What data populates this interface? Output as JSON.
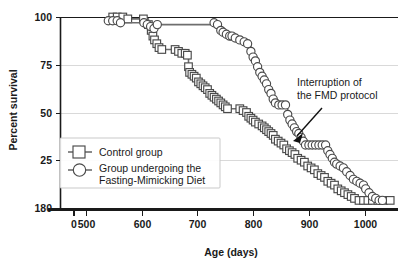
{
  "chart_data": {
    "type": "line",
    "title": "",
    "subtitle": "",
    "xlabel": "Age (days)",
    "ylabel": "Percent survival",
    "xlim": [
      500,
      1060
    ],
    "ylim": [
      0,
      100
    ],
    "grid": true,
    "grid_axis": "y",
    "legend_position": "lower-left-inside",
    "axis_break": {
      "axis": "x",
      "between": [
        0,
        500
      ],
      "note": "broken x axis between 0 and 500"
    },
    "xticks": [
      {
        "value": 0,
        "label": "0"
      },
      {
        "value": 500,
        "label": "500"
      },
      {
        "value": 600,
        "label": "600"
      },
      {
        "value": 700,
        "label": "700"
      },
      {
        "value": 800,
        "label": "800"
      },
      {
        "value": 900,
        "label": "900"
      },
      {
        "value": 1000,
        "label": "1000"
      }
    ],
    "yticks": [
      {
        "value": 0,
        "label": "180"
      },
      {
        "value": 25,
        "label": "25"
      },
      {
        "value": 50,
        "label": "50"
      },
      {
        "value": 75,
        "label": "75"
      },
      {
        "value": 100,
        "label": "100"
      }
    ],
    "annotations": [
      {
        "name": "interruption-annotation",
        "lines": [
          "Interruption of",
          "the FMD protocol"
        ],
        "text_x": 930,
        "text_y": 72,
        "arrow_from": [
          925,
          62
        ],
        "arrow_to": [
          897,
          36
        ]
      }
    ],
    "series": [
      {
        "name": "Control group",
        "legend_label": "Control group",
        "marker": "square",
        "color": "#4a4a4a",
        "line_color": "#6e6e6e",
        "points": [
          [
            548,
            100
          ],
          [
            556,
            100
          ],
          [
            566,
            100
          ],
          [
            575,
            99
          ],
          [
            603,
            99
          ],
          [
            612,
            96
          ],
          [
            617,
            93
          ],
          [
            620,
            90
          ],
          [
            623,
            88
          ],
          [
            627,
            86
          ],
          [
            631,
            84
          ],
          [
            636,
            83
          ],
          [
            660,
            83
          ],
          [
            666,
            82
          ],
          [
            672,
            81
          ],
          [
            678,
            81
          ],
          [
            682,
            80
          ],
          [
            684,
            74
          ],
          [
            686,
            71
          ],
          [
            690,
            70
          ],
          [
            694,
            69
          ],
          [
            698,
            68
          ],
          [
            702,
            66
          ],
          [
            706,
            65
          ],
          [
            710,
            64
          ],
          [
            714,
            63
          ],
          [
            718,
            62
          ],
          [
            722,
            60
          ],
          [
            726,
            59
          ],
          [
            730,
            58
          ],
          [
            734,
            57
          ],
          [
            738,
            56
          ],
          [
            742,
            55
          ],
          [
            746,
            54
          ],
          [
            750,
            53
          ],
          [
            754,
            52
          ],
          [
            776,
            52
          ],
          [
            782,
            51
          ],
          [
            788,
            50
          ],
          [
            792,
            48
          ],
          [
            796,
            47
          ],
          [
            800,
            46
          ],
          [
            804,
            45
          ],
          [
            810,
            44
          ],
          [
            816,
            43
          ],
          [
            820,
            42
          ],
          [
            824,
            41
          ],
          [
            828,
            40
          ],
          [
            832,
            39
          ],
          [
            836,
            38
          ],
          [
            840,
            36
          ],
          [
            845,
            35
          ],
          [
            850,
            34
          ],
          [
            855,
            33
          ],
          [
            860,
            31
          ],
          [
            865,
            30
          ],
          [
            870,
            29
          ],
          [
            875,
            28
          ],
          [
            880,
            26
          ],
          [
            886,
            25
          ],
          [
            892,
            24
          ],
          [
            898,
            22
          ],
          [
            904,
            21
          ],
          [
            910,
            20
          ],
          [
            916,
            18
          ],
          [
            922,
            17
          ],
          [
            928,
            16
          ],
          [
            934,
            14
          ],
          [
            940,
            13
          ],
          [
            946,
            12
          ],
          [
            952,
            10
          ],
          [
            958,
            9
          ],
          [
            964,
            8
          ],
          [
            970,
            7
          ],
          [
            976,
            6
          ],
          [
            982,
            5
          ],
          [
            990,
            4
          ],
          [
            998,
            4
          ],
          [
            1006,
            4
          ],
          [
            1014,
            4
          ],
          [
            1024,
            4
          ],
          [
            1034,
            4
          ],
          [
            1046,
            4
          ]
        ]
      },
      {
        "name": "Group undergoing the Fasting-Mimicking Diet",
        "legend_label_line1": "Group undergoing the",
        "legend_label_line2": "Fasting-Mimicking Diet",
        "marker": "circle",
        "color": "#4a4a4a",
        "line_color": "#6e6e6e",
        "points": [
          [
            540,
            98
          ],
          [
            548,
            98
          ],
          [
            556,
            98
          ],
          [
            562,
            97
          ],
          [
            604,
            97
          ],
          [
            610,
            96
          ],
          [
            616,
            95
          ],
          [
            622,
            94
          ],
          [
            628,
            96
          ],
          [
            730,
            97
          ],
          [
            736,
            96
          ],
          [
            742,
            93
          ],
          [
            746,
            92
          ],
          [
            752,
            91
          ],
          [
            758,
            90
          ],
          [
            762,
            90
          ],
          [
            768,
            89
          ],
          [
            776,
            88
          ],
          [
            784,
            87
          ],
          [
            790,
            86
          ],
          [
            796,
            82
          ],
          [
            800,
            79
          ],
          [
            804,
            77
          ],
          [
            808,
            74
          ],
          [
            812,
            71
          ],
          [
            816,
            69
          ],
          [
            820,
            67
          ],
          [
            824,
            65
          ],
          [
            828,
            62
          ],
          [
            832,
            60
          ],
          [
            836,
            57
          ],
          [
            840,
            55
          ],
          [
            846,
            54
          ],
          [
            852,
            54
          ],
          [
            858,
            54
          ],
          [
            862,
            49
          ],
          [
            866,
            46
          ],
          [
            870,
            44
          ],
          [
            874,
            42
          ],
          [
            878,
            40
          ],
          [
            882,
            39
          ],
          [
            886,
            37
          ],
          [
            890,
            35
          ],
          [
            894,
            33
          ],
          [
            900,
            33
          ],
          [
            906,
            33
          ],
          [
            912,
            33
          ],
          [
            918,
            33
          ],
          [
            924,
            33
          ],
          [
            930,
            33
          ],
          [
            934,
            30
          ],
          [
            938,
            28
          ],
          [
            942,
            26
          ],
          [
            946,
            24
          ],
          [
            950,
            23
          ],
          [
            956,
            22
          ],
          [
            962,
            21
          ],
          [
            968,
            19
          ],
          [
            974,
            17
          ],
          [
            980,
            15
          ],
          [
            986,
            14
          ],
          [
            992,
            13
          ],
          [
            998,
            12
          ],
          [
            1002,
            10
          ],
          [
            1008,
            8
          ],
          [
            1014,
            6
          ],
          [
            1020,
            5
          ],
          [
            1026,
            4
          ],
          [
            1032,
            4
          ]
        ]
      }
    ]
  },
  "legend": {
    "items": [
      {
        "marker": "square",
        "label_line1": "Control group",
        "label_line2": ""
      },
      {
        "marker": "circle",
        "label_line1": "Group undergoing the",
        "label_line2": "Fasting-Mimicking Diet"
      }
    ]
  },
  "annotation": {
    "line1": "Interruption of",
    "line2": "the FMD protocol"
  },
  "axes": {
    "x_title": "Age (days)",
    "y_title": "Percent survival"
  },
  "colors": {
    "marker_stroke": "#4a4a4a",
    "line": "#6e6e6e",
    "grid": "#d9d9d9",
    "axis": "#1a1a1a",
    "text": "#1a1a1a",
    "background": "#ffffff"
  }
}
